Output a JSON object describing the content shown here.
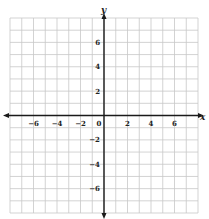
{
  "chart_data": {
    "type": "scatter",
    "title": "",
    "xlabel": "x",
    "ylabel": "y",
    "xlim": [
      -8,
      8
    ],
    "ylim": [
      -8,
      8
    ],
    "grid": true,
    "grid_step": 1,
    "x_ticks": [
      -6,
      -4,
      -2,
      0,
      2,
      4,
      6
    ],
    "y_ticks": [
      6,
      4,
      2,
      -2,
      -4,
      -6
    ],
    "x_tick_labels": [
      "−6",
      "−4",
      "−2",
      "0",
      "2",
      "4",
      "6"
    ],
    "y_tick_labels": [
      "6",
      "4",
      "2",
      "−2",
      "−4",
      "−6"
    ],
    "series": [],
    "colors": {
      "grid": "#c8c8c8",
      "axis": "#1a1a1a",
      "background": "#ffffff"
    }
  },
  "labels": {
    "x_axis": "x",
    "y_axis": "y"
  }
}
